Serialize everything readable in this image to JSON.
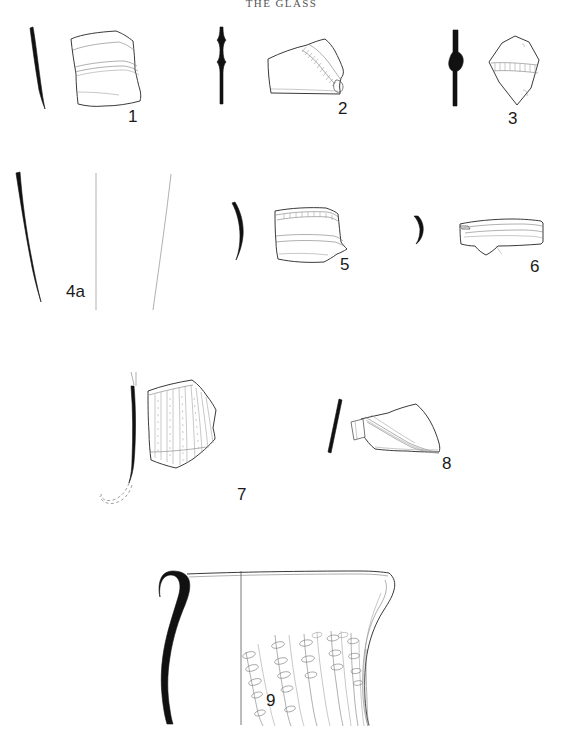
{
  "page": {
    "title": "THE GLASS",
    "width": 563,
    "height": 730,
    "background_color": "#ffffff",
    "ink_color": "#1a1a1a",
    "section_fill_color": "#111111",
    "outline_color": "#3a3a3a",
    "plate_type": "archaeological-illustration-plate"
  },
  "figures": [
    {
      "number": "1",
      "label_x": 128,
      "label_y": 108,
      "description": "Vessel body sherd with two horizontal applied trails; solid black curved profile section at left",
      "has_profile_section": true,
      "profile_style": "thin curved solid black",
      "decoration": "horizontal trails / bands"
    },
    {
      "number": "2",
      "label_x": 338,
      "label_y": 100,
      "description": "Sherd with stippled applied trail decoration along upper right edge; straight vertical solid black profile with thickened knop at left",
      "has_profile_section": true,
      "profile_style": "straight vertical solid black with swelling",
      "decoration": "applied stippled trail / rigaree"
    },
    {
      "number": "3",
      "label_x": 508,
      "label_y": 112,
      "description": "Hexagonal sherd with horizontal stippled trail across centre; solid black profile with central swelling at left",
      "has_profile_section": true,
      "profile_style": "straight solid black with central bulge",
      "decoration": "horizontal stippled trail"
    },
    {
      "number": "4a",
      "label_x": 66,
      "label_y": 291,
      "description": "Tall curved profile drawing: thick solid black section at left, two thin outline curves to the right",
      "has_profile_section": true,
      "profile_style": "thick curved solid black",
      "decoration": "none"
    },
    {
      "number": "5",
      "label_x": 340,
      "label_y": 256,
      "description": "Trapezoidal vessel sherd with two horizontal bands, one stippled; curved solid black profile at left",
      "has_profile_section": true,
      "profile_style": "curved solid black",
      "decoration": "horizontal bands"
    },
    {
      "number": "6",
      "label_x": 530,
      "label_y": 258,
      "description": "Elongated horizontal sherd drawn on its side; small lens-shaped solid black profile at left",
      "has_profile_section": true,
      "profile_style": "lens / leaf-shaped solid black",
      "decoration": "horizontal lines"
    },
    {
      "number": "7",
      "label_x": 238,
      "label_y": 492,
      "description": "Sherd with dense vertical ribbing; tall black curved profile at left with dashed reconstruction at its foot",
      "has_profile_section": true,
      "profile_style": "slender curved solid black with dashed reconstruction",
      "decoration": "vertical ribs / optic-blown flutes"
    },
    {
      "number": "8",
      "label_x": 443,
      "label_y": 470,
      "description": "Sherd with broad diagonal trail band running from upper left to lower right; slanted black profile line at left",
      "has_profile_section": true,
      "profile_style": "short slanted solid black",
      "decoration": "diagonal applied trail band"
    },
    {
      "number": "9",
      "label_x": 266,
      "label_y": 700,
      "description": "Large vessel upper body and rim: thick solid black rim and neck profile at left, rim line across the top, and diagonal rows of oval pinched bosses on the right half",
      "has_profile_section": true,
      "profile_style": "thick solid black everted rim and neck",
      "decoration": "diagonal rows of oval bosses between diagonal ribs"
    }
  ]
}
